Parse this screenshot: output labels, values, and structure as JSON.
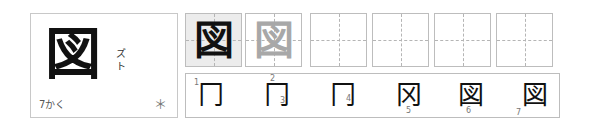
{
  "kanji": {
    "character": "図",
    "readings": [
      "ズ",
      "ト"
    ],
    "stroke_count_label": "7かく",
    "mark": "＊"
  },
  "practice_boxes": [
    {
      "char": "図",
      "style": "solid",
      "color": "#111111",
      "shaded": true
    },
    {
      "char": "図",
      "style": "trace",
      "color": "#a8a8a8",
      "shaded": false
    },
    {
      "char": "",
      "style": "empty",
      "shaded": false
    },
    {
      "char": "",
      "style": "empty",
      "shaded": false
    },
    {
      "char": "",
      "style": "empty",
      "shaded": false
    },
    {
      "char": "",
      "style": "empty",
      "shaded": false
    }
  ],
  "stroke_order": [
    {
      "step": 1,
      "glyph": "冂",
      "labels": [
        "1"
      ]
    },
    {
      "step": 2,
      "glyph": "冂",
      "labels": [
        "2",
        "3"
      ]
    },
    {
      "step": 3,
      "glyph": "冂",
      "labels": [
        "4"
      ]
    },
    {
      "step": 4,
      "glyph": "冈",
      "labels": [
        "5"
      ]
    },
    {
      "step": 5,
      "glyph": "図",
      "labels": [
        "6"
      ]
    },
    {
      "step": 6,
      "glyph": "図",
      "labels": [
        "7"
      ]
    }
  ],
  "colors": {
    "border": "#bdbdbd",
    "shaded_box": "#ececec",
    "trace": "#a8a8a8",
    "ink": "#111111"
  }
}
